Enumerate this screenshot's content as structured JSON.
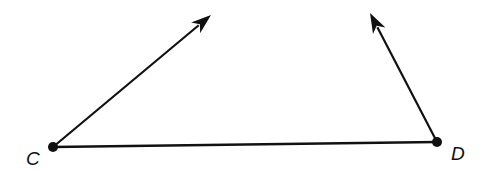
{
  "diagram": {
    "type": "geometry",
    "colors": {
      "stroke": "#111111",
      "background": "#ffffff"
    },
    "points": [
      {
        "id": "C",
        "label": "C",
        "x": 53,
        "y": 147,
        "label_x": 26,
        "label_y": 165
      },
      {
        "id": "D",
        "label": "D",
        "x": 437,
        "y": 142,
        "label_x": 451,
        "label_y": 160
      }
    ],
    "segments": [
      {
        "from": "C",
        "to": "D"
      }
    ],
    "rays": [
      {
        "from": "C",
        "tip_x": 211,
        "tip_y": 15
      },
      {
        "from": "D",
        "tip_x": 370,
        "tip_y": 13
      }
    ]
  }
}
